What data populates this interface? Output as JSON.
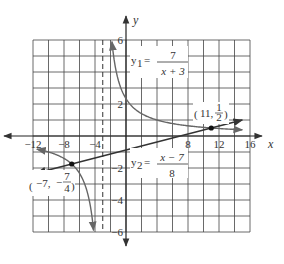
{
  "chart_data": {
    "type": "line",
    "title": "",
    "xlabel": "x",
    "ylabel": "y",
    "xlim": [
      -12,
      16
    ],
    "ylim": [
      -6,
      6
    ],
    "grid": true,
    "grid_x_step": 2,
    "grid_y_step": 1,
    "x_tick_labels": [
      "-12",
      "-8",
      "-4",
      "8",
      "12",
      "16"
    ],
    "x_tick_values": [
      -12,
      -8,
      -4,
      8,
      12,
      16
    ],
    "y_tick_labels": [
      "6",
      "2",
      "-2",
      "-4",
      "-6"
    ],
    "y_tick_values": [
      6,
      2,
      -2,
      -4,
      -6
    ],
    "series": [
      {
        "name": "y1",
        "label_lhs": "y",
        "label_sub": "1",
        "numerator": "7",
        "denominator": "x + 3",
        "kind": "rational",
        "formula": "7/(x+3)",
        "vertical_asymptote": -3,
        "color": "#555555"
      },
      {
        "name": "y2",
        "label_lhs": "y",
        "label_sub": "2",
        "numerator": "x − 7",
        "denominator": "8",
        "kind": "linear",
        "formula": "(x-7)/8",
        "color": "#333333"
      }
    ],
    "intersections": [
      {
        "x": -7,
        "y": -1.75,
        "label_x": "−7,",
        "label_y_num": "7",
        "label_y_sign": "−",
        "label_y_den": "4"
      },
      {
        "x": 11,
        "y": 0.5,
        "label_x": "11,",
        "label_y_num": "1",
        "label_y_den": "2"
      }
    ],
    "asymptote_style": "dashed"
  }
}
